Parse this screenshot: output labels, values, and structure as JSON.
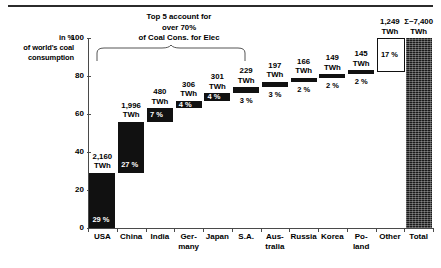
{
  "annotation": {
    "line1": "Top 5 account for",
    "line2": "over 70%",
    "line3": "of Coal Cons. for Elec"
  },
  "y_axis_label": {
    "line1": "in %",
    "line2": "of world's coal",
    "line3": "consumption"
  },
  "chart_data": {
    "type": "bar",
    "title": "",
    "subtitle": "",
    "xlabel": "",
    "ylabel": "in % of world's coal consumption",
    "ylim": [
      0,
      100
    ],
    "yticks": [
      "0",
      "20",
      "40",
      "60",
      "80",
      "100"
    ],
    "grid": false,
    "legend": "none",
    "annotations": [
      "Top 5 account for over 70% of Coal Cons. for Elec"
    ],
    "categories": [
      "USA",
      "China",
      "India",
      "Germany",
      "Japan",
      "S.A.",
      "Australia",
      "Russia",
      "Korea",
      "Poland",
      "Other",
      "Total"
    ],
    "values_pct": [
      29,
      27,
      7,
      4,
      4,
      3,
      3,
      2,
      2,
      2,
      17,
      100
    ],
    "values_twh": [
      2160,
      1996,
      480,
      306,
      301,
      229,
      197,
      166,
      149,
      145,
      1249,
      7400
    ],
    "cumulative_start_pct": [
      0,
      29,
      56,
      63,
      67,
      71,
      74,
      77,
      79,
      81,
      83,
      0
    ],
    "bars": [
      {
        "category": "USA",
        "label_line1": "USA",
        "label_line2": "",
        "value_text": "2,160",
        "unit": "TWh",
        "pct_text": "29 %",
        "pct_inside": true,
        "start": 0,
        "end": 29,
        "style": "solid"
      },
      {
        "category": "China",
        "label_line1": "China",
        "label_line2": "",
        "value_text": "1,996",
        "unit": "TWh",
        "pct_text": "27 %",
        "pct_inside": true,
        "start": 29,
        "end": 56,
        "style": "solid"
      },
      {
        "category": "India",
        "label_line1": "India",
        "label_line2": "",
        "value_text": "480",
        "unit": "TWh",
        "pct_text": "7 %",
        "pct_inside": true,
        "start": 56,
        "end": 63,
        "style": "solid"
      },
      {
        "category": "Germany",
        "label_line1": "Ger-",
        "label_line2": "many",
        "value_text": "306",
        "unit": "TWh",
        "pct_text": "4 %",
        "pct_inside": true,
        "start": 63,
        "end": 67,
        "style": "solid"
      },
      {
        "category": "Japan",
        "label_line1": "Japan",
        "label_line2": "",
        "value_text": "301",
        "unit": "TWh",
        "pct_text": "4 %",
        "pct_inside": true,
        "start": 67,
        "end": 71,
        "style": "solid"
      },
      {
        "category": "S.A.",
        "label_line1": "S.A.",
        "label_line2": "",
        "value_text": "229",
        "unit": "TWh",
        "pct_text": "3 %",
        "pct_inside": false,
        "start": 71,
        "end": 74,
        "style": "solid"
      },
      {
        "category": "Australia",
        "label_line1": "Aus-",
        "label_line2": "tralia",
        "value_text": "197",
        "unit": "TWh",
        "pct_text": "3 %",
        "pct_inside": false,
        "start": 74,
        "end": 77,
        "style": "solid"
      },
      {
        "category": "Russia",
        "label_line1": "Russia",
        "label_line2": "",
        "value_text": "166",
        "unit": "TWh",
        "pct_text": "2 %",
        "pct_inside": false,
        "start": 77,
        "end": 79,
        "style": "solid"
      },
      {
        "category": "Korea",
        "label_line1": "Korea",
        "label_line2": "",
        "value_text": "149",
        "unit": "TWh",
        "pct_text": "2 %",
        "pct_inside": false,
        "start": 79,
        "end": 81,
        "style": "solid"
      },
      {
        "category": "Poland",
        "label_line1": "Po-",
        "label_line2": "land",
        "value_text": "145",
        "unit": "TWh",
        "pct_text": "2 %",
        "pct_inside": false,
        "start": 81,
        "end": 83,
        "style": "solid"
      },
      {
        "category": "Other",
        "label_line1": "Other",
        "label_line2": "",
        "value_text": "1,249",
        "unit": "TWh",
        "pct_text": "17 %",
        "pct_inside": true,
        "start": 83,
        "end": 100,
        "style": "hollow"
      },
      {
        "category": "Total",
        "label_line1": "Total",
        "label_line2": "",
        "value_text": "Σ~7,400",
        "unit": "TWh",
        "pct_text": "",
        "pct_inside": false,
        "start": 0,
        "end": 100,
        "style": "total"
      }
    ]
  },
  "colors": {
    "bar_fill": "#111111",
    "hollow_fill": "#ffffff",
    "axis": "#4a4a4a",
    "text": "#000000",
    "inverse_text": "#ffffff"
  }
}
